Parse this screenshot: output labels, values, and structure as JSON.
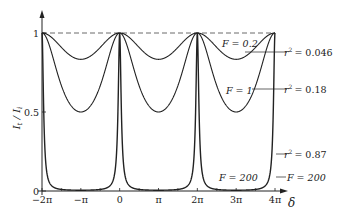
{
  "chart_data": {
    "type": "line",
    "title": "",
    "xlabel": "δ",
    "ylabel": "I_t / I_i",
    "xlim": [
      -6.2832,
      12.5664
    ],
    "ylim": [
      0,
      1
    ],
    "x_ticks": [
      {
        "value": -6.2832,
        "label": "−2π"
      },
      {
        "value": -3.1416,
        "label": "−π"
      },
      {
        "value": 0,
        "label": "0"
      },
      {
        "value": 3.1416,
        "label": "π"
      },
      {
        "value": 6.2832,
        "label": "2π"
      },
      {
        "value": 9.4248,
        "label": "3π"
      },
      {
        "value": 12.5664,
        "label": "4π"
      }
    ],
    "y_ticks": [
      {
        "value": 0,
        "label": "0"
      },
      {
        "value": 0.5,
        "label": "0.5"
      },
      {
        "value": 1,
        "label": "1"
      }
    ],
    "formula": "I_t/I_i = 1 / (1 + F sin^2(δ/2))",
    "series": [
      {
        "name": "F = 0.2",
        "F": 0.2,
        "r2": 0.046,
        "min_value": 0.833
      },
      {
        "name": "F = 1",
        "F": 1,
        "r2": 0.18,
        "min_value": 0.5
      },
      {
        "name": "F = 200",
        "F": 200,
        "r2": 0.87,
        "min_value": 0.005
      }
    ],
    "annotations": [
      {
        "text": "F = 0.2",
        "target": "F = 0.2"
      },
      {
        "text": "r² = 0.046",
        "target": "F = 0.2"
      },
      {
        "text": "F = 1",
        "target": "F = 1"
      },
      {
        "text": "r² = 0.18",
        "target": "F = 1"
      },
      {
        "text": "r² = 0.87",
        "target": "F = 200"
      },
      {
        "text": "F = 200",
        "target": "F = 200"
      },
      {
        "text": "F = 200",
        "target": "F = 200"
      }
    ],
    "reference_line": {
      "y": 1,
      "style": "dashed"
    }
  },
  "labels": {
    "ylabel_main": "I",
    "ylabel_sub1": "t",
    "ylabel_slash": " / I",
    "ylabel_sub2": "i",
    "xlabel": "δ",
    "ann_f02": "F = 0.2",
    "ann_r046": "= 0.046",
    "ann_f1": "F = 1",
    "ann_r18": "= 0.18",
    "ann_r87": "= 0.87",
    "ann_f200_right": "F = 200",
    "ann_f200_mid": "F = 200",
    "r": "r",
    "sup2": "2"
  }
}
